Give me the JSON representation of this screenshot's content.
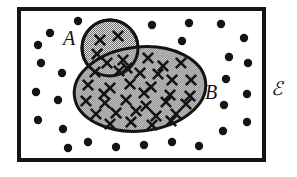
{
  "figure": {
    "type": "venn-diagram",
    "width": 297,
    "height": 177,
    "background_color": "#ffffff"
  },
  "colors": {
    "stroke": "#141414",
    "set_fill_gray": "#a8a8a8",
    "element_dot": "#141414",
    "element_cross": "#141414",
    "universe_background": "#ffffff"
  },
  "universe": {
    "label": "ℰ",
    "label_name": "universal-set-label",
    "rect": {
      "x": 19,
      "y": 9,
      "width": 245,
      "height": 151
    },
    "border_width": 4,
    "label_position": {
      "x": 277,
      "y": 95
    },
    "label_font_size": 19
  },
  "sets": [
    {
      "id": "A",
      "label": "A",
      "shape": "circle",
      "cx": 110,
      "cy": 48,
      "rx": 28,
      "ry": 28,
      "rotation": 0,
      "stroke_width": 3,
      "label_position": {
        "x": 69,
        "y": 45
      },
      "label_font_size": 20
    },
    {
      "id": "B",
      "label": "B",
      "shape": "ellipse",
      "cx": 140,
      "cy": 89,
      "rx": 66,
      "ry": 42,
      "rotation": -6,
      "stroke_width": 3,
      "label_position": {
        "x": 211,
        "y": 99
      },
      "label_font_size": 20
    }
  ],
  "chart_data": {
    "type": "venn",
    "region_counts": {
      "A_only": 3,
      "A_and_B": 2,
      "B_only": 33,
      "outside_both": 27
    },
    "marker_legend": {
      "cross": "element that is a member of set A or set B",
      "dot": "element of the universal set that is in neither A nor B"
    },
    "crosses_A_only": [
      {
        "x": 100,
        "y": 40
      },
      {
        "x": 118,
        "y": 36
      },
      {
        "x": 97,
        "y": 54
      }
    ],
    "crosses_intersection": [
      {
        "x": 107,
        "y": 63
      },
      {
        "x": 123,
        "y": 60
      }
    ],
    "crosses_B_only": [
      {
        "x": 148,
        "y": 58
      },
      {
        "x": 140,
        "y": 73
      },
      {
        "x": 163,
        "y": 66
      },
      {
        "x": 181,
        "y": 63
      },
      {
        "x": 172,
        "y": 80
      },
      {
        "x": 191,
        "y": 80
      },
      {
        "x": 88,
        "y": 85
      },
      {
        "x": 110,
        "y": 88
      },
      {
        "x": 130,
        "y": 84
      },
      {
        "x": 151,
        "y": 87
      },
      {
        "x": 170,
        "y": 95
      },
      {
        "x": 190,
        "y": 96
      },
      {
        "x": 86,
        "y": 101
      },
      {
        "x": 105,
        "y": 103
      },
      {
        "x": 126,
        "y": 100
      },
      {
        "x": 146,
        "y": 106
      },
      {
        "x": 166,
        "y": 102
      },
      {
        "x": 186,
        "y": 104
      },
      {
        "x": 96,
        "y": 114
      },
      {
        "x": 116,
        "y": 113
      },
      {
        "x": 136,
        "y": 111
      },
      {
        "x": 156,
        "y": 116
      },
      {
        "x": 176,
        "y": 114
      },
      {
        "x": 110,
        "y": 124
      },
      {
        "x": 131,
        "y": 122
      },
      {
        "x": 152,
        "y": 125
      },
      {
        "x": 171,
        "y": 121
      },
      {
        "x": 95,
        "y": 72
      },
      {
        "x": 119,
        "y": 71
      },
      {
        "x": 158,
        "y": 74
      },
      {
        "x": 144,
        "y": 93
      },
      {
        "x": 127,
        "y": 68
      },
      {
        "x": 104,
        "y": 94
      }
    ],
    "dots_outside": [
      {
        "x": 78,
        "y": 21
      },
      {
        "x": 50,
        "y": 33
      },
      {
        "x": 38,
        "y": 45
      },
      {
        "x": 41,
        "y": 63
      },
      {
        "x": 62,
        "y": 73
      },
      {
        "x": 36,
        "y": 92
      },
      {
        "x": 58,
        "y": 100
      },
      {
        "x": 38,
        "y": 120
      },
      {
        "x": 63,
        "y": 129
      },
      {
        "x": 152,
        "y": 25
      },
      {
        "x": 189,
        "y": 23
      },
      {
        "x": 221,
        "y": 24
      },
      {
        "x": 182,
        "y": 41
      },
      {
        "x": 244,
        "y": 38
      },
      {
        "x": 229,
        "y": 57
      },
      {
        "x": 248,
        "y": 63
      },
      {
        "x": 226,
        "y": 79
      },
      {
        "x": 247,
        "y": 94
      },
      {
        "x": 224,
        "y": 105
      },
      {
        "x": 247,
        "y": 122
      },
      {
        "x": 223,
        "y": 131
      },
      {
        "x": 88,
        "y": 142
      },
      {
        "x": 116,
        "y": 147
      },
      {
        "x": 144,
        "y": 145
      },
      {
        "x": 172,
        "y": 142
      },
      {
        "x": 199,
        "y": 146
      },
      {
        "x": 68,
        "y": 148
      }
    ],
    "dot_radius": 4.2,
    "cross_size": 5.2,
    "cross_stroke_width": 2.6
  }
}
